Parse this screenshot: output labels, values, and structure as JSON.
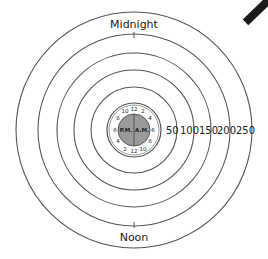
{
  "diagram": {
    "type": "radial 24-hour clock plot",
    "labels": {
      "top": "Midnight",
      "bottom": "Noon",
      "inner_left": "P.M.",
      "inner_right": "A.M."
    },
    "scale_labels": [
      "50",
      "100",
      "150",
      "200",
      "250"
    ],
    "clock_ring_labels": {
      "am_side": [
        "12",
        "2",
        "4",
        "6",
        "8",
        "10",
        "12"
      ],
      "pm_side": [
        "12",
        "10",
        "8",
        "6",
        "4",
        "2",
        "12"
      ]
    },
    "bars": [
      {
        "name": "gray-bar",
        "color": "#b8b8b8",
        "angle_deg": 14,
        "approx_value": 140
      },
      {
        "name": "black-bar",
        "color": "#1a1a1a",
        "angle_deg": 46,
        "approx_value": 115
      }
    ],
    "colors": {
      "ring_line": "#555555",
      "inner_disk": "#9a9a9a",
      "background": "#ffffff"
    }
  }
}
